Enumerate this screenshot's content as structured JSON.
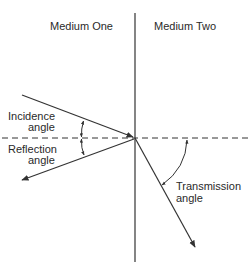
{
  "diagram": {
    "labels": {
      "medium_one": "Medium One",
      "medium_two": "Medium Two",
      "incidence_line1": "Incidence",
      "incidence_line2": "angle",
      "reflection_line1": "Reflection",
      "reflection_line2": "angle",
      "transmission_line1": "Transmission",
      "transmission_line2": "angle"
    },
    "colors": {
      "line": "#333333",
      "text": "#2a2a2a",
      "background": "#ffffff"
    }
  }
}
